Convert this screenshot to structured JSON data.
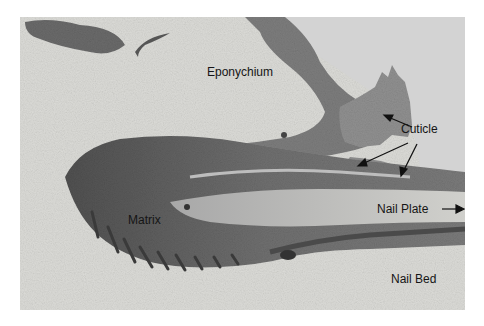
{
  "figure": {
    "colors": {
      "background_page": "#ffffff",
      "dermis": "#dcdcd8",
      "epithelium_dark": "#6e6e6e",
      "epithelium_mid": "#8c8c8c",
      "nail_plate": "#c8c8c4",
      "cuticle": "#9a9a9a",
      "empty_space": "#d2d2d2",
      "label_text": "#151515"
    }
  },
  "labels": {
    "eponychium": "Eponychium",
    "cuticle": "Cuticle",
    "matrix": "Matrix",
    "nail_plate": "Nail Plate",
    "nail_bed": "Nail Bed"
  }
}
